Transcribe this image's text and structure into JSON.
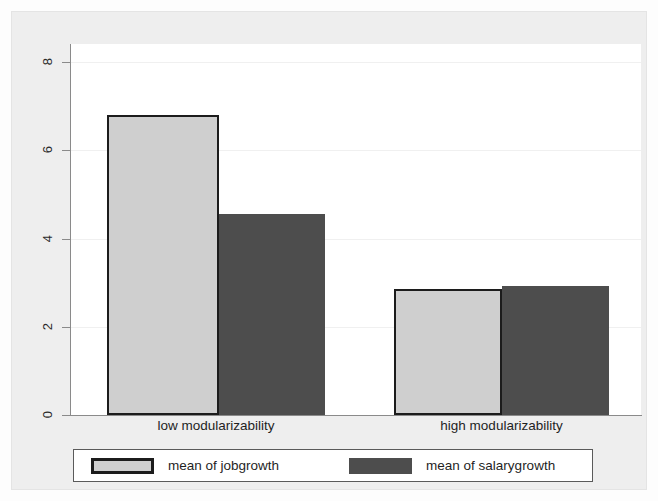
{
  "chart_data": {
    "type": "bar",
    "title": "",
    "subtitle": "",
    "xlabel": "",
    "ylabel": "",
    "categories": [
      "low modularizability",
      "high modularizability"
    ],
    "series": [
      {
        "name": "mean of jobgrowth",
        "values": [
          6.8,
          2.85
        ],
        "color": "#cfcfcf",
        "border_color": "#1c1c1c"
      },
      {
        "name": "mean of salarygrowth",
        "values": [
          4.55,
          2.92
        ],
        "color": "#4d4d4d",
        "border_color": "none"
      }
    ],
    "ylim": [
      0,
      8.4
    ],
    "yticks": [
      "0",
      "2",
      "4",
      "6",
      "8"
    ],
    "ytick_values": [
      0,
      2,
      4,
      6,
      8
    ],
    "grid": true,
    "grid_axis": "y",
    "legend_position": "bottom",
    "bar_style": "grouped-adjacent"
  },
  "axis": {
    "y_tick_labels": [
      "0",
      "2",
      "4",
      "6",
      "8"
    ]
  },
  "categories": [
    {
      "label": "low modularizability"
    },
    {
      "label": "high modularizability"
    }
  ],
  "legend": {
    "entries": [
      {
        "label": "mean of jobgrowth",
        "swatch": "light-swatch"
      },
      {
        "label": "mean of salarygrowth",
        "swatch": "dark-swatch"
      }
    ]
  },
  "colors": {
    "light_bar": "#cfcfcf",
    "dark_bar": "#4d4d4d",
    "bar_outline": "#1c1c1c",
    "axis": "#8a8a8a",
    "background": "#eeeeee",
    "plot_background": "#ffffff"
  }
}
